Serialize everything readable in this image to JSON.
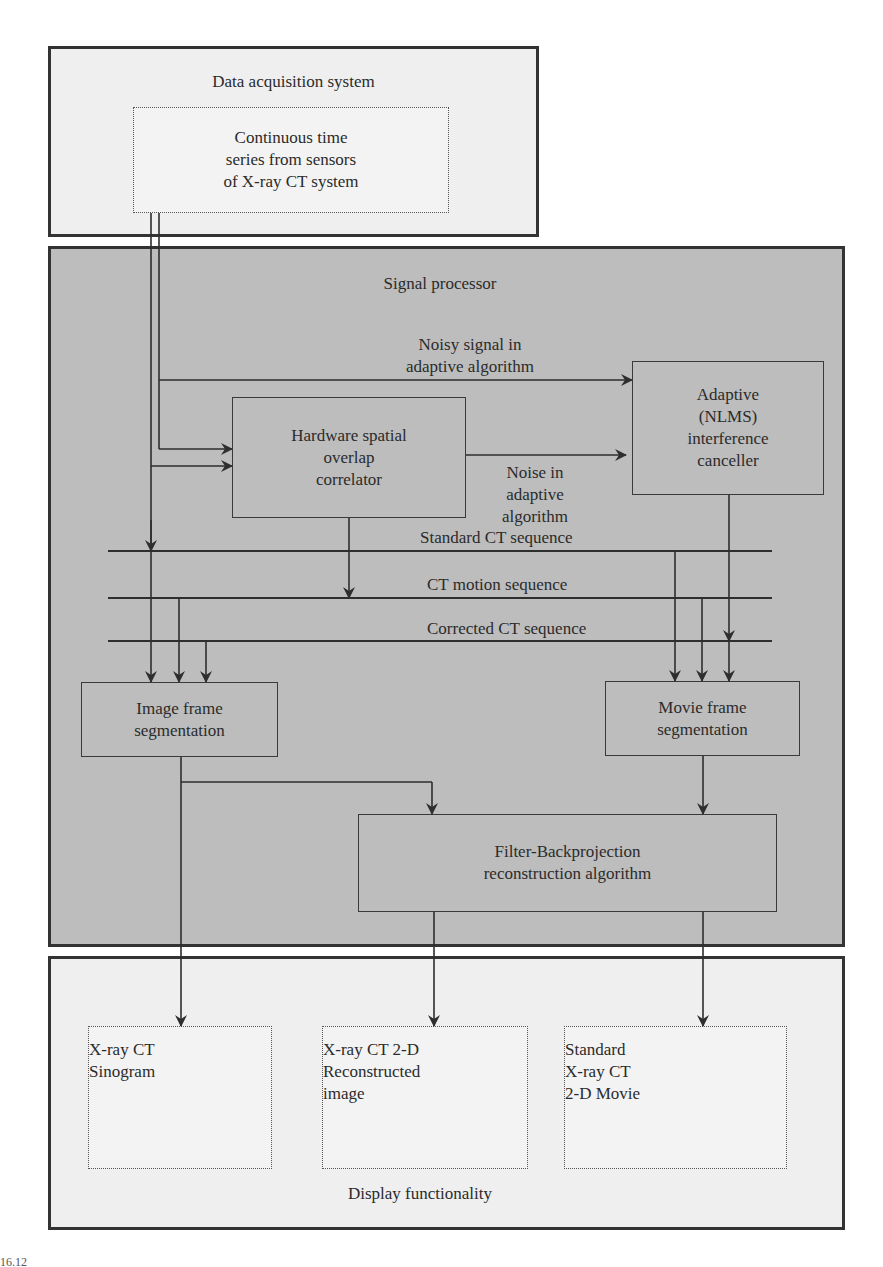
{
  "diagram": {
    "data_acquisition": {
      "title": "Data acquisition system",
      "sensor_box": [
        "Continuous time",
        "series from sensors",
        "of X-ray CT system"
      ]
    },
    "signal_processor": {
      "title": "Signal processor",
      "noisy_signal_label": [
        "Noisy signal in",
        "adaptive algorithm"
      ],
      "noise_label": [
        "Noise  in",
        "adaptive",
        "algorithm"
      ],
      "hardware_box": [
        "Hardware spatial",
        "overlap",
        "correlator"
      ],
      "adaptive_box": [
        "Adaptive",
        "(NLMS)",
        "interference",
        "canceller"
      ],
      "buses": [
        "Standard CT sequence",
        "CT motion sequence",
        "Corrected CT sequence"
      ],
      "image_frame_box": [
        "Image frame",
        "segmentation"
      ],
      "movie_frame_box": [
        "Movie frame",
        "segmentation"
      ],
      "filter_box": [
        "Filter-Backprojection",
        "reconstruction algorithm"
      ]
    },
    "display": {
      "title": "Display functionality",
      "sinogram_box": [
        "X-ray CT",
        "Sinogram"
      ],
      "reconstructed_box": [
        "X-ray CT 2-D",
        "Reconstructed",
        "image"
      ],
      "movie_box": [
        "Standard",
        "X-ray CT",
        "2-D Movie"
      ]
    },
    "caption_fragment": "16.12"
  },
  "colors": {
    "outer_light_fill": "#efefef",
    "signal_processor_fill": "#bdbdbd",
    "line": "#2e2e2e"
  }
}
